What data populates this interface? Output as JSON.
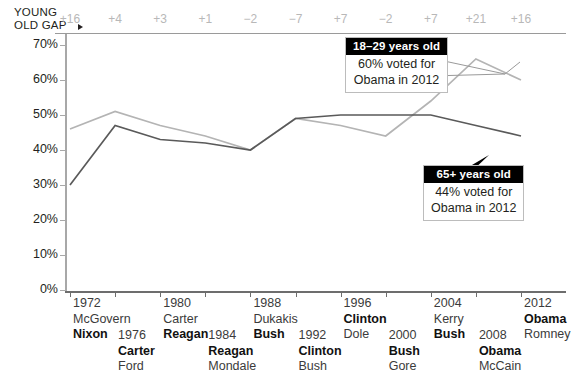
{
  "axis_label": {
    "line1": "YOUNG",
    "line2": "OLD GAP",
    "arrow_icon": "right-triangle-icon"
  },
  "y_axis": {
    "labels": [
      "70%",
      "60%",
      "50%",
      "40%",
      "30%",
      "20%",
      "10%",
      "0%"
    ],
    "min": 0,
    "max": 70
  },
  "gap_row": {
    "values": [
      "+16",
      "+4",
      "+3",
      "+1",
      "−2",
      "−7",
      "+7",
      "−2",
      "+7",
      "+21",
      "+16"
    ],
    "color": "#b8b8b8"
  },
  "elections": [
    {
      "year": "1972",
      "loser": "McGovern",
      "winner": "Nixon",
      "row": "top"
    },
    {
      "year": "1976",
      "winner": "Carter",
      "loser": "Ford",
      "row": "bottom"
    },
    {
      "year": "1980",
      "loser": "Carter",
      "winner": "Reagan",
      "row": "top"
    },
    {
      "year": "1984",
      "loser": "Mondale",
      "winner": "Reagan",
      "row": "bottom"
    },
    {
      "year": "1988",
      "loser": "Dukakis",
      "winner": "Bush",
      "row": "top"
    },
    {
      "year": "1992",
      "winner": "Clinton",
      "loser": "Bush",
      "row": "bottom"
    },
    {
      "year": "1996",
      "winner": "Clinton",
      "loser": "Dole",
      "row": "top"
    },
    {
      "year": "2000",
      "loser": "Gore",
      "winner": "Bush",
      "row": "bottom"
    },
    {
      "year": "2004",
      "loser": "Kerry",
      "winner": "Bush",
      "row": "top"
    },
    {
      "year": "2008",
      "winner": "Obama",
      "loser": "McCain",
      "row": "bottom"
    },
    {
      "year": "2012",
      "winner": "Obama",
      "loser": "Romney",
      "row": "top"
    }
  ],
  "x_axis_ticks": [
    "1972",
    "1980",
    "1988",
    "1996",
    "2004",
    "2012"
  ],
  "callouts": [
    {
      "header": "18–29 years old",
      "line1": "60% voted for",
      "line2": "Obama in 2012"
    },
    {
      "header": "65+ years old",
      "line1": "44% voted for",
      "line2": "Obama in 2012"
    }
  ],
  "chart_data": {
    "type": "line",
    "title": "",
    "xlabel": "",
    "ylabel": "",
    "ylim": [
      0,
      70
    ],
    "grid": false,
    "legend_position": "annotations",
    "x": [
      1972,
      1976,
      1980,
      1984,
      1988,
      1992,
      1996,
      2000,
      2004,
      2008,
      2012
    ],
    "categories": [
      "1972",
      "1976",
      "1980",
      "1984",
      "1988",
      "1992",
      "1996",
      "2000",
      "2004",
      "2008",
      "2012"
    ],
    "series": [
      {
        "name": "18–29 years old",
        "color": "#b4b4b4",
        "values": [
          46,
          51,
          47,
          44,
          40,
          49,
          47,
          44,
          54,
          66,
          60
        ]
      },
      {
        "name": "65+ years old",
        "color": "#5a5a5a",
        "values": [
          30,
          47,
          43,
          42,
          40,
          49,
          50,
          50,
          50,
          47,
          44
        ]
      }
    ],
    "gap": [
      16,
      4,
      3,
      1,
      -2,
      -7,
      7,
      -2,
      7,
      21,
      16
    ],
    "annotations": [
      "18–29 years old: 60% voted for Obama in 2012",
      "65+ years old: 44% voted for Obama in 2012"
    ]
  }
}
